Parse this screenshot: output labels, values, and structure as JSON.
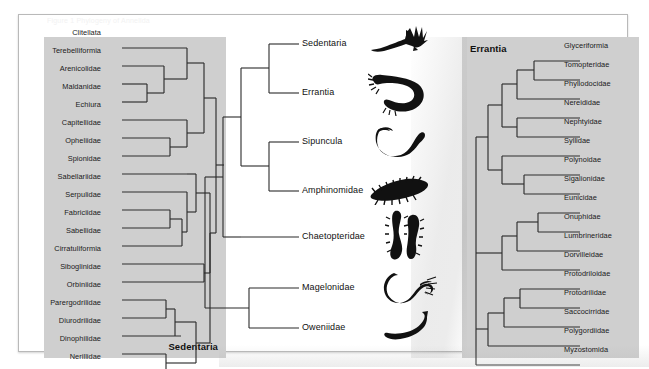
{
  "figure": {
    "faint_caption": "Figure 1  Phylogeny of Annelida",
    "frame_border_color": "#b9b9b9",
    "panel_background_color": "#cfcfcf",
    "line_color": "#2b2b2b"
  },
  "left_panel": {
    "title": "Sedentaria",
    "orientation": "leaves-left",
    "taxa": [
      {
        "label": "Clitellata",
        "y": 33
      },
      {
        "label": "Terebelliformia",
        "y": 51
      },
      {
        "label": "Arenicolidae",
        "y": 69
      },
      {
        "label": "Maldanidae",
        "y": 87
      },
      {
        "label": "Echiura",
        "y": 105
      },
      {
        "label": "Capitellidae",
        "y": 123
      },
      {
        "label": "Opheliidae",
        "y": 141
      },
      {
        "label": "Spionidae",
        "y": 159
      },
      {
        "label": "Sabellariidae",
        "y": 177
      },
      {
        "label": "Serpulidae",
        "y": 195
      },
      {
        "label": "Fabriciidae",
        "y": 213
      },
      {
        "label": "Sabellidae",
        "y": 231
      },
      {
        "label": "Cirratuliformia",
        "y": 249
      },
      {
        "label": "Siboglinidae",
        "y": 267
      },
      {
        "label": "Orbiniidae",
        "y": 285
      },
      {
        "label": "Parergodrilidae",
        "y": 303
      },
      {
        "label": "Diurodrilidae",
        "y": 321
      },
      {
        "label": "Dinophilidae",
        "y": 339
      },
      {
        "label": "Nerillidae",
        "y": 357
      }
    ]
  },
  "center_tree": {
    "tips": [
      {
        "label": "Sedentaria",
        "y": 43,
        "icon": "fan-worm-silhouette"
      },
      {
        "label": "Errantia",
        "y": 92,
        "icon": "bristle-worm-silhouette"
      },
      {
        "label": "Sipuncula",
        "y": 141,
        "icon": "peanut-worm-silhouette"
      },
      {
        "label": "Amphinomidae",
        "y": 190,
        "icon": "fireworm-silhouette"
      },
      {
        "label": "Chaetopteridae",
        "y": 236,
        "icon": "chaetopterid-silhouette"
      },
      {
        "label": "Magelonidae",
        "y": 287,
        "icon": "magelonid-silhouette"
      },
      {
        "label": "Oweniidae",
        "y": 327,
        "icon": "oweniid-silhouette"
      }
    ]
  },
  "right_panel": {
    "title": "Errantia",
    "orientation": "leaves-right",
    "taxa": [
      {
        "label": "Glyceriformia",
        "y": 46
      },
      {
        "label": "Tomopteridae",
        "y": 65
      },
      {
        "label": "Phyllodocidae",
        "y": 84
      },
      {
        "label": "Nereididae",
        "y": 103
      },
      {
        "label": "Nephtyidae",
        "y": 122
      },
      {
        "label": "Syllidae",
        "y": 141
      },
      {
        "label": "Polynoidae",
        "y": 160
      },
      {
        "label": "Sigalionidae",
        "y": 179
      },
      {
        "label": "Eunicidae",
        "y": 198
      },
      {
        "label": "Onuphidae",
        "y": 217
      },
      {
        "label": "Lumbrineridae",
        "y": 236
      },
      {
        "label": "Dorvilleidae",
        "y": 255
      },
      {
        "label": "Protodriloidae",
        "y": 274
      },
      {
        "label": "Protodrilidae",
        "y": 293
      },
      {
        "label": "Saccocirridae",
        "y": 312
      },
      {
        "label": "Polygordiidae",
        "y": 331
      },
      {
        "label": "Myzostomida",
        "y": 350
      }
    ]
  }
}
